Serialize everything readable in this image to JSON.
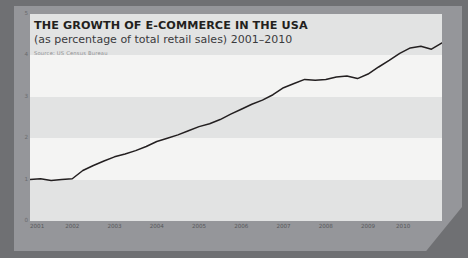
{
  "header": {
    "title": "THE GROWTH OF E-COMMERCE IN THE USA",
    "subtitle": "(as percentage of total retail sales) 2001–2010",
    "source": "Source: US Census Bureau"
  },
  "colors": {
    "outer_frame": "#6f7073",
    "axis_panel": "#95969a",
    "plot_background": "#f4f4f3",
    "band": "#e2e3e3",
    "line": "#231f20",
    "title_text": "#231f20",
    "tick_text": "#6a6b6e"
  },
  "chart_data": {
    "type": "line",
    "title": "THE GROWTH OF E-COMMERCE IN THE USA",
    "subtitle": "(as percentage of total retail sales) 2001–2010",
    "xlabel": "",
    "ylabel": "",
    "ylim": [
      0,
      5
    ],
    "xlim": [
      2001,
      2010.75
    ],
    "grid": true,
    "legend": false,
    "ytick_labels": [
      "5",
      "4",
      "3",
      "2",
      "1",
      "0"
    ],
    "ytick_values": [
      5,
      4,
      3,
      2,
      1,
      0
    ],
    "xtick_labels": [
      "2001",
      "2002",
      "2003",
      "2004",
      "2005",
      "2006",
      "2007",
      "2008",
      "2009",
      "2010"
    ],
    "xtick_values": [
      2001,
      2002,
      2003,
      2004,
      2005,
      2006,
      2007,
      2008,
      2009,
      2010
    ],
    "series": [
      {
        "name": "E-commerce share of total retail sales",
        "x": [
          2001,
          2001.25,
          2001.5,
          2001.75,
          2002,
          2002.25,
          2002.5,
          2002.75,
          2003,
          2003.25,
          2003.5,
          2003.75,
          2004,
          2004.25,
          2004.5,
          2004.75,
          2005,
          2005.25,
          2005.5,
          2005.75,
          2006,
          2006.25,
          2006.5,
          2006.75,
          2007,
          2007.25,
          2007.5,
          2007.75,
          2008,
          2008.25,
          2008.5,
          2008.75,
          2009,
          2009.25,
          2009.5,
          2009.75,
          2010,
          2010.25,
          2010.5,
          2010.75
        ],
        "values": [
          1.0,
          1.02,
          0.98,
          1.0,
          1.02,
          1.22,
          1.34,
          1.45,
          1.55,
          1.62,
          1.7,
          1.8,
          1.92,
          2.0,
          2.08,
          2.18,
          2.28,
          2.35,
          2.45,
          2.58,
          2.7,
          2.82,
          2.92,
          3.05,
          3.22,
          3.32,
          3.42,
          3.4,
          3.42,
          3.48,
          3.5,
          3.44,
          3.55,
          3.72,
          3.88,
          4.05,
          4.18,
          4.22,
          4.15,
          4.3
        ]
      }
    ]
  }
}
